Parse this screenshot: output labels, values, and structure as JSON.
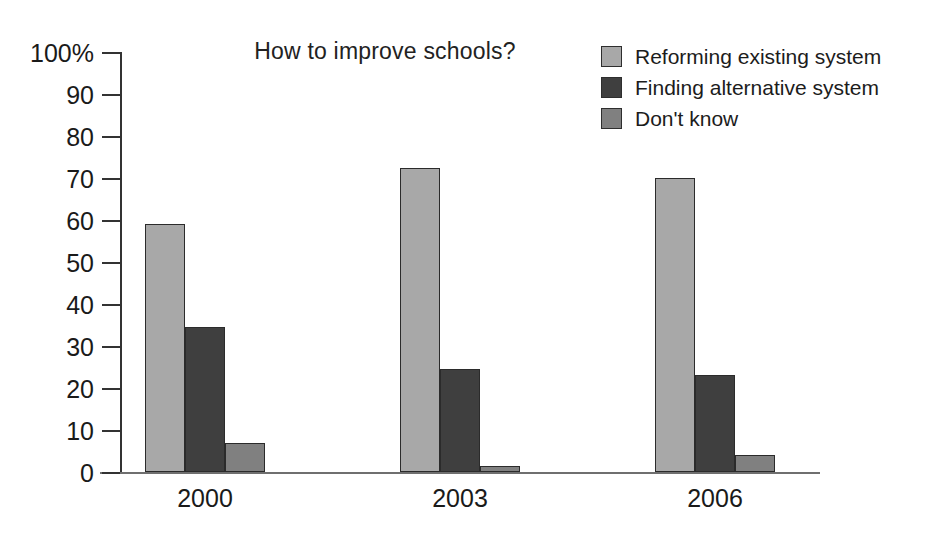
{
  "chart_data": {
    "type": "bar",
    "title": "How to improve schools?",
    "categories": [
      "2000",
      "2003",
      "2006"
    ],
    "series": [
      {
        "name": "Reforming existing system",
        "color": "#a8a8a8",
        "values": [
          59,
          72.5,
          70
        ]
      },
      {
        "name": "Finding alternative system",
        "color": "#3f3f3f",
        "values": [
          34.5,
          24.5,
          23
        ]
      },
      {
        "name": "Don't know",
        "color": "#808080",
        "values": [
          7,
          1.5,
          4
        ]
      }
    ],
    "xlabel": "",
    "ylabel": "",
    "ylim": [
      0,
      100
    ],
    "ytick_labels": [
      "100%",
      "90",
      "80",
      "70",
      "60",
      "50",
      "40",
      "30",
      "20",
      "10",
      "0"
    ],
    "ytick_values": [
      100,
      90,
      80,
      70,
      60,
      50,
      40,
      30,
      20,
      10,
      0
    ],
    "grid": false,
    "legend_position": "top-right"
  },
  "axis": {
    "ticks": [
      {
        "label": "100%",
        "value": 100
      },
      {
        "label": "90",
        "value": 90
      },
      {
        "label": "80",
        "value": 80
      },
      {
        "label": "70",
        "value": 70
      },
      {
        "label": "60",
        "value": 60
      },
      {
        "label": "50",
        "value": 50
      },
      {
        "label": "40",
        "value": 40
      },
      {
        "label": "30",
        "value": 30
      },
      {
        "label": "20",
        "value": 20
      },
      {
        "label": "10",
        "value": 10
      },
      {
        "label": "0",
        "value": 0
      }
    ]
  }
}
